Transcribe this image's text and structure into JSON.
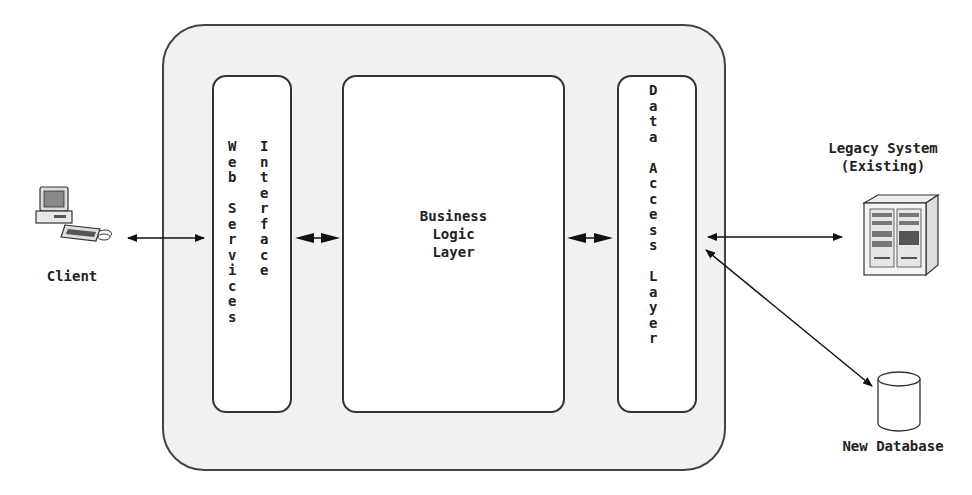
{
  "diagram": {
    "title": "",
    "container": {
      "label": ""
    },
    "nodes": {
      "client": {
        "label": "Client",
        "icon": "desktop-computer-icon"
      },
      "web_services_interface": {
        "label_col1": "Web Services",
        "label_col2": "Interface"
      },
      "business_logic_layer": {
        "line1": "Business",
        "line2": "Logic",
        "line3": "Layer"
      },
      "data_access_layer": {
        "label": "Data Access Layer"
      },
      "legacy_system": {
        "line1": "Legacy System",
        "line2": "(Existing)",
        "icon": "server-cabinet-icon"
      },
      "new_database": {
        "label": "New Database",
        "icon": "database-cylinder-icon"
      }
    },
    "edges": [
      {
        "from": "client",
        "to": "web_services_interface",
        "type": "bidirectional"
      },
      {
        "from": "web_services_interface",
        "to": "business_logic_layer",
        "type": "bidirectional"
      },
      {
        "from": "business_logic_layer",
        "to": "data_access_layer",
        "type": "bidirectional"
      },
      {
        "from": "data_access_layer",
        "to": "legacy_system",
        "type": "bidirectional"
      },
      {
        "from": "data_access_layer",
        "to": "new_database",
        "type": "bidirectional"
      }
    ],
    "colors": {
      "container_fill": "#f1f1f1",
      "box_fill": "#ffffff",
      "stroke": "#333333"
    }
  }
}
